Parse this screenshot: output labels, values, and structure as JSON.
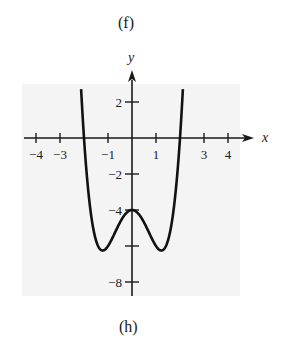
{
  "top_label": "(f)",
  "bottom_label": "(h)",
  "chart_data": {
    "type": "line",
    "title": "",
    "function": "y = x^4 - 3x^2 - 4",
    "xlabel": "x",
    "ylabel": "y",
    "xlim": [
      -4,
      4
    ],
    "ylim": [
      -8,
      2
    ],
    "x_ticks": [
      -4,
      -3,
      -1,
      1,
      3,
      4
    ],
    "x_tick_labels": [
      "−4",
      "−3",
      "−1",
      "1",
      "3",
      "4"
    ],
    "y_ticks": [
      2,
      -2,
      -4,
      -6,
      -8
    ],
    "y_tick_labels": [
      "2",
      "−2",
      "−4",
      "",
      "−8"
    ],
    "key_points": [
      {
        "x": -2,
        "y": 0,
        "note": "x-intercept"
      },
      {
        "x": 2,
        "y": 0,
        "note": "x-intercept"
      },
      {
        "x": 0,
        "y": -4,
        "note": "local maximum"
      },
      {
        "x": -1.22,
        "y": -6.25,
        "note": "local minimum"
      },
      {
        "x": 1.22,
        "y": -6.25,
        "note": "local minimum"
      }
    ],
    "grid": false,
    "legend": null
  }
}
